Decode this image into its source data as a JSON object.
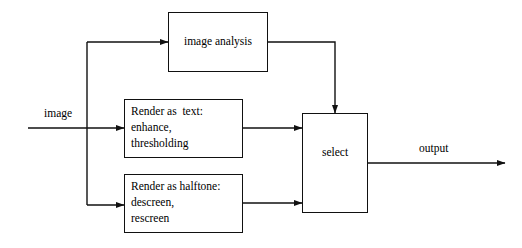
{
  "diagram": {
    "stroke_color": "#111111",
    "background_color": "#ffffff",
    "nodes": [
      {
        "id": "image-analysis",
        "label": "image analysis",
        "lines": [
          "image analysis"
        ],
        "align": "center",
        "x": 168,
        "y": 12,
        "w": 100,
        "h": 60
      },
      {
        "id": "render-as-text",
        "label": "Render as  text:",
        "lines": [
          "Render as  text:",
          "enhance,",
          "thresholding"
        ],
        "align": "left",
        "x": 124,
        "y": 99,
        "w": 119,
        "h": 59
      },
      {
        "id": "render-as-halftone",
        "label": "Render as halftone:",
        "lines": [
          "Render as halftone:",
          "descreen,",
          "rescreen"
        ],
        "align": "left",
        "x": 124,
        "y": 174,
        "w": 119,
        "h": 59
      },
      {
        "id": "select",
        "label": "select",
        "lines": [
          "select"
        ],
        "align": "center",
        "x": 302,
        "y": 113,
        "w": 66,
        "h": 100
      }
    ],
    "edge_labels": [
      {
        "id": "input-label",
        "text": "image",
        "x": 44,
        "y": 107
      },
      {
        "id": "output-label",
        "text": "output",
        "x": 419,
        "y": 142
      }
    ]
  }
}
